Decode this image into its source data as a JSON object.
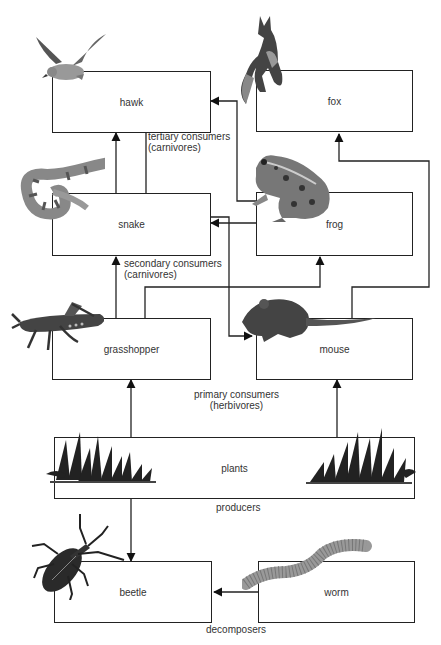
{
  "organisms": {
    "hawk": "hawk",
    "fox": "fox",
    "snake": "snake",
    "frog": "frog",
    "grasshopper": "grasshopper",
    "mouse": "mouse",
    "plants": "plants",
    "beetle": "beetle",
    "worm": "worm"
  },
  "levels": {
    "tertiary": [
      "tertiary consumers",
      "(carnivores)"
    ],
    "secondary": [
      "secondary consumers",
      "(carnivores)"
    ],
    "primary": [
      "primary consumers",
      "(herbivores)"
    ],
    "producers": "producers",
    "decomposers": "decomposers"
  },
  "arrows": [
    {
      "from": "snake",
      "to": "hawk"
    },
    {
      "from": "grasshopper",
      "to": "hawk"
    },
    {
      "from": "frog",
      "to": "hawk"
    },
    {
      "from": "mouse",
      "to": "hawk"
    },
    {
      "from": "frog",
      "to": "snake"
    },
    {
      "from": "grasshopper",
      "to": "snake"
    },
    {
      "from": "grasshopper",
      "to": "frog"
    },
    {
      "from": "mouse",
      "to": "fox"
    },
    {
      "from": "plants",
      "to": "grasshopper"
    },
    {
      "from": "plants",
      "to": "mouse"
    },
    {
      "from": "plants",
      "to": "beetle"
    },
    {
      "from": "worm",
      "to": "beetle"
    }
  ],
  "icons": [
    "hawk-illustration",
    "fox-illustration",
    "snake-illustration",
    "frog-illustration",
    "grasshopper-illustration",
    "mouse-illustration",
    "grass-illustration",
    "beetle-illustration",
    "worm-illustration"
  ]
}
